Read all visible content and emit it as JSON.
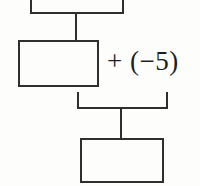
{
  "diagram": {
    "type": "bar-model-flowchart",
    "background_color": "#fdfdfb",
    "line_color": "#2f2f2f",
    "text_color": "#1e1e1e",
    "nodes": [
      {
        "id": "top-box",
        "label": "",
        "cropped": true,
        "x": 30,
        "y": -14,
        "width": 94,
        "height": 28
      },
      {
        "id": "middle-box",
        "label": "",
        "cropped": false,
        "x": 18,
        "y": 40,
        "width": 81,
        "height": 47
      },
      {
        "id": "result-box",
        "label": "",
        "cropped": false,
        "x": 80,
        "y": 138,
        "width": 84,
        "height": 45
      }
    ],
    "connectors": [
      {
        "id": "top-to-middle-stem",
        "orientation": "vertical",
        "x": 75,
        "y": 13,
        "length": 28
      },
      {
        "id": "bracket-left-stem",
        "orientation": "vertical",
        "x": 77,
        "y": 92,
        "length": 17
      },
      {
        "id": "bracket-right-stem",
        "orientation": "vertical",
        "x": 166,
        "y": 92,
        "length": 17
      },
      {
        "id": "bracket-crossbar",
        "orientation": "horizontal",
        "x": 77,
        "y": 107,
        "length": 91
      },
      {
        "id": "bracket-to-result-stem",
        "orientation": "vertical",
        "x": 120,
        "y": 108,
        "length": 31
      }
    ],
    "operation": {
      "id": "add-negative-five",
      "text": "+ (−5)",
      "operator": "+",
      "operand": "−5",
      "font_size_px": 27,
      "x": 107,
      "y": 48
    }
  }
}
